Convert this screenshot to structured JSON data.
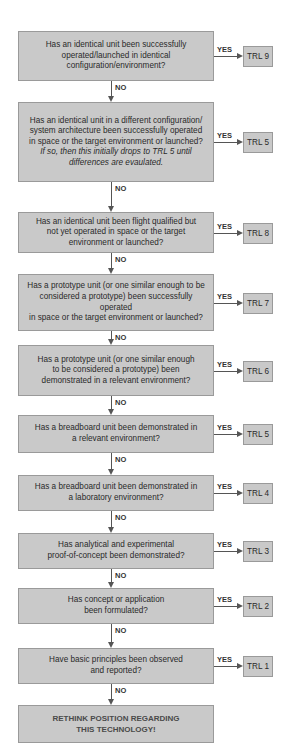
{
  "flowchart": {
    "yes_label": "YES",
    "no_label": "NO",
    "steps": [
      {
        "question": [
          "Has an identical unit been successfully",
          "operated/launched in identical",
          "configuration/environment?"
        ],
        "note": [],
        "result": "TRL 9"
      },
      {
        "question": [
          "Has an identical unit in a different configuration/",
          "system architecture been successfully operated",
          "in space or the target environment or launched?"
        ],
        "note": [
          "If so, then this initially drops to TRL 5 until",
          "differences are evaulated."
        ],
        "result": "TRL 5"
      },
      {
        "question": [
          "Has an identical unit been flight qualified but",
          "not yet operated in space or the target",
          "environment or launched?"
        ],
        "note": [],
        "result": "TRL 8"
      },
      {
        "question": [
          "Has a prototype unit (or one similar enough to be",
          "considered a prototype) been successfully operated",
          "in space or the target environment or launched?"
        ],
        "note": [],
        "result": "TRL 7"
      },
      {
        "question": [
          "Has a prototype unit (or one similar enough",
          "to be considered a prototype) been",
          "demonstrated in a relevant environment?"
        ],
        "note": [],
        "result": "TRL 6"
      },
      {
        "question": [
          "Has a breadboard unit been demonstrated in",
          "a relevant environment?"
        ],
        "note": [],
        "result": "TRL 5"
      },
      {
        "question": [
          "Has a breadboard unit been demonstrated in",
          "a laboratory environment?"
        ],
        "note": [],
        "result": "TRL 4"
      },
      {
        "question": [
          "Has analytical and experimental",
          "proof-of-concept been demonstrated?"
        ],
        "note": [],
        "result": "TRL 3"
      },
      {
        "question": [
          "Has concept or application",
          "been formulated?"
        ],
        "note": [],
        "result": "TRL 2"
      },
      {
        "question": [
          "Have basic principles been observed",
          "and reported?"
        ],
        "note": [],
        "result": "TRL 1"
      }
    ],
    "final": [
      "RETHINK POSITION REGARDING",
      "THIS TECHNOLOGY!"
    ]
  },
  "colors": {
    "box_fill": "#c9c9c9",
    "box_border": "#9a9a9a",
    "arrow": "#555555"
  }
}
